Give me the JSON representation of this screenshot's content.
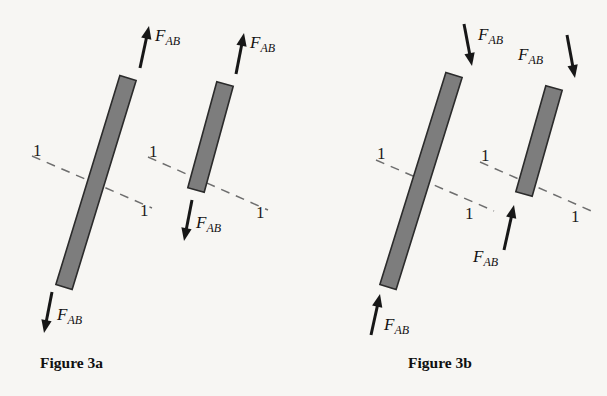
{
  "figure": {
    "background_color": "#f7f6f3",
    "bar_fill_color": "#7d7d7d",
    "bar_stroke_color": "#2b2b2b",
    "arrow_color": "#171717",
    "dash_color": "#6e6e6e"
  },
  "panels": [
    {
      "id": "panel-a",
      "caption": "Figure 3a",
      "caption_x": 40,
      "caption_y": 368,
      "description": "Inclined bar in tension, shown whole and separated at section 1-1",
      "members": [
        {
          "id": "member-a-full",
          "name": "uncut-bar",
          "bar": {
            "x1": 128,
            "y1": 78,
            "x2": 64,
            "y2": 287,
            "width": 17
          },
          "section_line": {
            "x1": 32,
            "y1": 156,
            "x2": 152,
            "y2": 208
          },
          "section_labels": [
            {
              "text": "1",
              "x": 33,
              "y": 156
            },
            {
              "text": "1",
              "x": 140,
              "y": 216
            }
          ],
          "forces": [
            {
              "id": "force-a1-top",
              "label": "F",
              "sublabel": "AB",
              "direction": "up",
              "tail": {
                "x": 140,
                "y": 68
              },
              "head": {
                "x": 149,
                "y": 26
              },
              "label_x": 155,
              "label_y": 41
            },
            {
              "id": "force-a1-bottom",
              "label": "F",
              "sublabel": "AB",
              "direction": "down",
              "tail": {
                "x": 52,
                "y": 292
              },
              "head": {
                "x": 44,
                "y": 333
              },
              "label_x": 57,
              "label_y": 320
            }
          ]
        },
        {
          "id": "member-a-cut",
          "name": "cut-bar-upper",
          "bar": {
            "x1": 225,
            "y1": 84,
            "x2": 196,
            "y2": 190,
            "width": 17
          },
          "section_line": {
            "x1": 148,
            "y1": 157,
            "x2": 268,
            "y2": 210
          },
          "section_labels": [
            {
              "text": "1",
              "x": 149,
              "y": 157
            },
            {
              "text": "1",
              "x": 256,
              "y": 218
            }
          ],
          "forces": [
            {
              "id": "force-a2-top",
              "label": "F",
              "sublabel": "AB",
              "direction": "up",
              "tail": {
                "x": 236,
                "y": 74
              },
              "head": {
                "x": 244,
                "y": 33
              },
              "label_x": 250,
              "label_y": 48
            },
            {
              "id": "force-a2-bottom",
              "label": "F",
              "sublabel": "AB",
              "direction": "down",
              "tail": {
                "x": 192,
                "y": 200
              },
              "head": {
                "x": 184,
                "y": 241
              },
              "label_x": 196,
              "label_y": 228
            }
          ]
        }
      ]
    },
    {
      "id": "panel-b",
      "caption": "Figure 3b",
      "caption_x": 408,
      "caption_y": 368,
      "description": "Inclined bar in compression, shown whole and separated at section 1-1",
      "members": [
        {
          "id": "member-b-full",
          "name": "uncut-bar",
          "bar": {
            "x1": 454,
            "y1": 75,
            "x2": 388,
            "y2": 287,
            "width": 17
          },
          "section_line": {
            "x1": 376,
            "y1": 160,
            "x2": 494,
            "y2": 211
          },
          "section_labels": [
            {
              "text": "1",
              "x": 377,
              "y": 159
            },
            {
              "text": "1",
              "x": 465,
              "y": 219
            }
          ],
          "forces": [
            {
              "id": "force-b1-top",
              "label": "F",
              "sublabel": "AB",
              "direction": "down",
              "tail": {
                "x": 464,
                "y": 24
              },
              "head": {
                "x": 472,
                "y": 66
              },
              "label_x": 478,
              "label_y": 40
            },
            {
              "id": "force-b1-bottom",
              "label": "F",
              "sublabel": "AB",
              "direction": "up",
              "tail": {
                "x": 371,
                "y": 335
              },
              "head": {
                "x": 380,
                "y": 294
              },
              "label_x": 384,
              "label_y": 330
            }
          ]
        },
        {
          "id": "member-b-cut",
          "name": "cut-bar-upper",
          "bar": {
            "x1": 554,
            "y1": 88,
            "x2": 524,
            "y2": 194,
            "width": 17
          },
          "section_line": {
            "x1": 480,
            "y1": 162,
            "x2": 596,
            "y2": 213
          },
          "section_labels": [
            {
              "text": "1",
              "x": 481,
              "y": 161
            },
            {
              "text": "1",
              "x": 571,
              "y": 222
            }
          ],
          "forces": [
            {
              "id": "force-b2-top",
              "label": "F",
              "sublabel": "AB",
              "direction": "down",
              "tail": {
                "x": 567,
                "y": 35
              },
              "head": {
                "x": 575,
                "y": 78
              },
              "label_x": 518,
              "label_y": 60
            },
            {
              "id": "force-b2-bottom",
              "label": "F",
              "sublabel": "AB",
              "direction": "up",
              "tail": {
                "x": 504,
                "y": 250
              },
              "head": {
                "x": 514,
                "y": 205
              },
              "label_x": 473,
              "label_y": 262
            }
          ]
        }
      ]
    }
  ]
}
